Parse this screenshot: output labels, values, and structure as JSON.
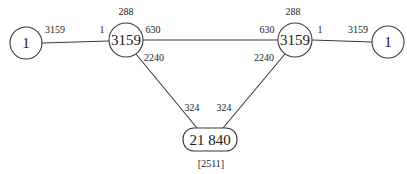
{
  "diagram": {
    "type": "network-graph",
    "colors": {
      "stroke": "#3a3a3a",
      "text": "#1a1a1a",
      "background": "#ffffff"
    },
    "nodes": [
      {
        "id": "n1",
        "label": "1",
        "shape": "circle"
      },
      {
        "id": "n2",
        "label": "3159",
        "shape": "circle",
        "top_label": "288"
      },
      {
        "id": "n3",
        "label": "3159",
        "shape": "circle",
        "top_label": "288"
      },
      {
        "id": "n4",
        "label": "1",
        "shape": "circle"
      },
      {
        "id": "n5",
        "label": "21 840",
        "shape": "rounded-rect",
        "bottom_label": "[2511]"
      }
    ],
    "edges": [
      {
        "from": "n1",
        "to": "n2",
        "from_label": "3159",
        "to_label": "1"
      },
      {
        "from": "n2",
        "to": "n3",
        "from_label": "630",
        "to_label": "630"
      },
      {
        "from": "n3",
        "to": "n4",
        "from_label": "1",
        "to_label": "3159"
      },
      {
        "from": "n2",
        "to": "n5",
        "from_label": "2240",
        "to_label": "324"
      },
      {
        "from": "n3",
        "to": "n5",
        "from_label": "2240",
        "to_label": "324"
      }
    ]
  }
}
